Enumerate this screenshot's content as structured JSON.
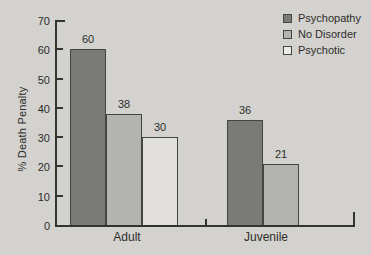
{
  "figure": {
    "background_color": "#d3d2cf",
    "text_color": "#2d2d29",
    "axis_color": "#34342f"
  },
  "chart_data": {
    "type": "bar",
    "title": "",
    "xlabel": "",
    "ylabel": "% Death Penalty",
    "ylim": [
      0,
      70
    ],
    "yticks": [
      0,
      10,
      20,
      30,
      40,
      50,
      60,
      70
    ],
    "grid": false,
    "bar_value_labels_shown": true,
    "categories": [
      "Adult",
      "Juvenile"
    ],
    "series": [
      {
        "name": "Psychopathy",
        "values": [
          60,
          36
        ],
        "color": "#7a7a77",
        "border_color": "#45453f"
      },
      {
        "name": "No Disorder",
        "values": [
          38,
          21
        ],
        "color": "#b3b3af",
        "border_color": "#45453f"
      },
      {
        "name": "Psychotic",
        "values": [
          30,
          null
        ],
        "color": "#e1e0dc",
        "border_color": "#45453f"
      }
    ],
    "legend": {
      "position": "top-right",
      "entries": [
        "Psychopathy",
        "No Disorder",
        "Psychotic"
      ]
    }
  }
}
